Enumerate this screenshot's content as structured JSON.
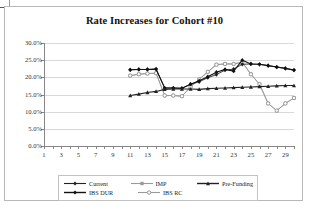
{
  "chart_data": {
    "type": "line",
    "title": "Rate Increases for Cohort #10",
    "xlabel": "",
    "ylabel": "",
    "ylim": [
      0,
      30
    ],
    "ytick_labels": [
      "0.0%",
      "5.0%",
      "10.0%",
      "15.0%",
      "20.0%",
      "25.0%",
      "30.0%"
    ],
    "ytick_values": [
      0,
      5,
      10,
      15,
      20,
      25,
      30
    ],
    "xlim": [
      1,
      30
    ],
    "xtick_labels": [
      "1",
      "3",
      "5",
      "7",
      "9",
      "11",
      "13",
      "15",
      "17",
      "19",
      "21",
      "23",
      "25",
      "27",
      "29"
    ],
    "xtick_values": [
      1,
      3,
      5,
      7,
      9,
      11,
      13,
      15,
      17,
      19,
      21,
      23,
      25,
      27,
      29
    ],
    "grid": "horizontal",
    "legend_position": "bottom",
    "x": [
      11,
      12,
      13,
      14,
      15,
      16,
      17,
      18,
      19,
      20,
      21,
      22,
      23,
      24,
      25,
      26,
      27,
      28,
      29,
      30
    ],
    "series": [
      {
        "name": "Current",
        "marker": "diamond",
        "color": "#222222",
        "values": [
          22.2,
          22.3,
          22.3,
          22.4,
          16.9,
          16.9,
          16.8,
          18.0,
          18.7,
          19.9,
          20.8,
          22.1,
          22.4,
          23.8,
          23.9,
          23.8,
          23.4,
          23.0,
          22.6,
          22.1
        ]
      },
      {
        "name": "IMP",
        "marker": "square",
        "color": "#9a9a9a",
        "values": [
          20.5,
          20.9,
          21.1,
          21.2,
          14.7,
          14.7,
          14.5,
          17.2,
          19.4,
          21.6,
          23.7,
          23.9,
          23.9,
          24.4,
          20.9,
          18.0,
          12.4,
          10.3,
          12.4,
          14.0
        ]
      },
      {
        "name": "Pre-Funding",
        "marker": "triangle",
        "color": "#222222",
        "values": [
          14.7,
          15.1,
          15.6,
          15.9,
          16.5,
          16.6,
          16.6,
          16.6,
          16.5,
          16.7,
          16.8,
          16.9,
          17.0,
          17.1,
          17.2,
          17.3,
          17.4,
          17.5,
          17.6,
          17.6
        ]
      },
      {
        "name": "IBS DUR",
        "marker": "diamond",
        "color": "#111111",
        "values": [
          22.2,
          22.3,
          22.3,
          22.4,
          16.9,
          16.9,
          16.8,
          18.0,
          19.0,
          20.2,
          21.5,
          22.3,
          21.8,
          25.0,
          23.9,
          23.8,
          23.4,
          23.0,
          22.6,
          22.1
        ]
      },
      {
        "name": "IBS RC",
        "marker": "circle",
        "color": "#9a9a9a",
        "values": [
          20.5,
          20.9,
          21.1,
          21.2,
          14.7,
          14.7,
          14.5,
          17.2,
          19.4,
          21.6,
          23.7,
          23.9,
          23.9,
          24.4,
          20.9,
          18.0,
          12.4,
          10.3,
          12.4,
          14.0
        ]
      }
    ]
  },
  "legend": {
    "rows": [
      [
        {
          "label": "Current",
          "marker": "diamond",
          "color": "#222222"
        },
        {
          "label": "IMP",
          "marker": "square",
          "color": "#9a9a9a"
        },
        {
          "label": "Pre-Funding",
          "marker": "triangle",
          "color": "#222222"
        }
      ],
      [
        {
          "label": "IBS DUR",
          "marker": "diamond",
          "color": "#111111"
        },
        {
          "label": "IBS RC",
          "marker": "circle",
          "color": "#9a9a9a"
        }
      ]
    ]
  }
}
